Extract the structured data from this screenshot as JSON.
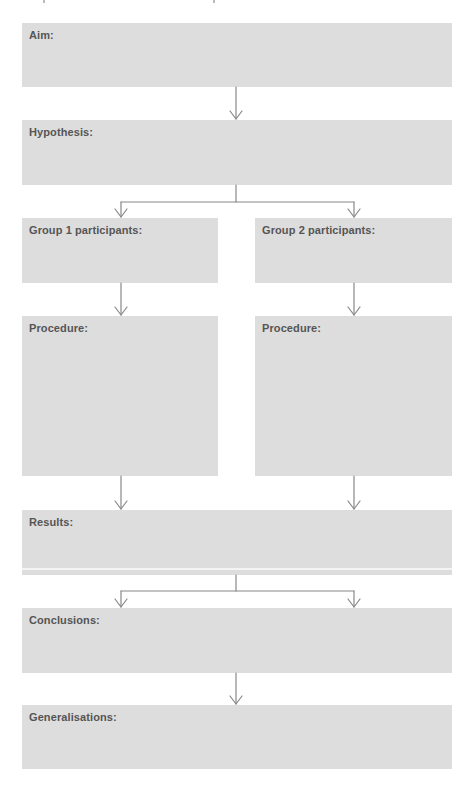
{
  "diagram": {
    "type": "research-method-flowchart",
    "colors": {
      "box_fill": "#dddddd",
      "label_text": "#555555",
      "connector": "#888888",
      "background": "#ffffff"
    },
    "boxes": {
      "aim": {
        "label": "Aim:"
      },
      "hypothesis": {
        "label": "Hypothesis:"
      },
      "group1": {
        "label": "Group 1 participants:"
      },
      "group2": {
        "label": "Group 2 participants:"
      },
      "procedure1": {
        "label": "Procedure:"
      },
      "procedure2": {
        "label": "Procedure:"
      },
      "results": {
        "label": "Results:"
      },
      "conclusions": {
        "label": "Conclusions:"
      },
      "generalisations": {
        "label": "Generalisations:"
      }
    },
    "edges": [
      [
        "aim",
        "hypothesis"
      ],
      [
        "hypothesis",
        "group1"
      ],
      [
        "hypothesis",
        "group2"
      ],
      [
        "group1",
        "procedure1"
      ],
      [
        "group2",
        "procedure2"
      ],
      [
        "procedure1",
        "results"
      ],
      [
        "procedure2",
        "results"
      ],
      [
        "results",
        "conclusions"
      ],
      [
        "conclusions",
        "generalisations"
      ]
    ]
  }
}
